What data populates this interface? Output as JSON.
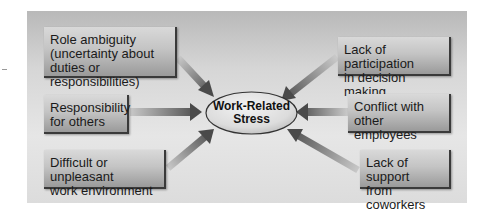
{
  "diagram": {
    "center": {
      "label": "Work-Related\nStress"
    },
    "sources": [
      {
        "id": "b1",
        "side": "left",
        "label": "Role ambiguity\n(uncertainty about\nduties or responsibilities)"
      },
      {
        "id": "b2",
        "side": "left",
        "label": "Responsibility\nfor others"
      },
      {
        "id": "b3",
        "side": "left",
        "label": "Difficult or unpleasant\nwork environment"
      },
      {
        "id": "b4",
        "side": "right",
        "label": "Lack of participation\nin decision making"
      },
      {
        "id": "b5",
        "side": "right",
        "label": "Conflict with other\nemployees"
      },
      {
        "id": "b6",
        "side": "right",
        "label": "Lack of support\nfrom coworkers"
      }
    ],
    "colors": {
      "panel_top": "#b9b9b9",
      "panel_bottom": "#e6e6e6",
      "box_light": "#d9d9d9",
      "box_dark": "#9a9a9a",
      "arrow_dark": "#4a4a4a",
      "arrow_light": "#c8c8c8",
      "ellipse_fill": "#e2e2e2",
      "ellipse_stroke": "#333333"
    }
  }
}
